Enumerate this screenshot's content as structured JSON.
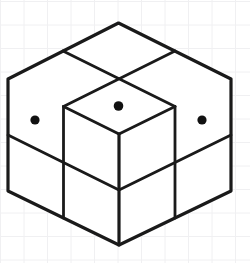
{
  "canvas": {
    "width": 250,
    "height": 263,
    "background_color": "#ffffff",
    "title": "Isometric cube illustration"
  },
  "background_grid": {
    "visible": true,
    "line_color": "#f0f0f2",
    "line_width": 1,
    "spacing": 23.5,
    "offset_x": 0.5,
    "offset_y": 1.5,
    "description": "faint light-gray graph paper grid"
  },
  "figure": {
    "name": "isometric-cube",
    "stroke_color": "#1a1a1a",
    "fill_color": "#ffffff",
    "outline_width": 3.2,
    "divider_width": 2.8
  },
  "geometry": {
    "apex_top": [
      118.5,
      23
    ],
    "vertex_left": [
      8,
      79
    ],
    "vertex_right": [
      231,
      79
    ],
    "vertex_center": [
      119,
      134
    ],
    "bottom_left": [
      8,
      191
    ],
    "bottom_right": [
      231,
      191
    ],
    "bottom_apex": [
      119,
      245
    ],
    "top_edge_mid_left": [
      63,
      51
    ],
    "top_edge_mid_right": [
      175,
      51
    ],
    "top_mid_left": [
      63.5,
      106.5
    ],
    "top_mid_right": [
      175,
      106.5
    ],
    "left_face_mid_v_top": [
      63.5,
      106.5
    ],
    "left_face_mid_v_bottom": [
      63.5,
      218
    ],
    "right_face_mid_v_top": [
      175,
      106.5
    ],
    "right_face_mid_v_bottom": [
      175,
      218
    ],
    "left_face_h_start": [
      8,
      135
    ],
    "left_face_h_end": [
      119,
      190
    ],
    "right_face_h_start": [
      119,
      190
    ],
    "right_face_h_end": [
      231,
      135
    ],
    "outline_path": "M118.5,23 L231,79 L231,191 L119,245 L8,191 L8,79 Z"
  },
  "dots": [
    {
      "name": "dot-left-face",
      "face": "left",
      "cell": "upper-left",
      "cx": 35,
      "cy": 120,
      "r": 4.6,
      "color": "#111111"
    },
    {
      "name": "dot-top-face",
      "face": "top",
      "cell": "front-center",
      "cx": 118.5,
      "cy": 106,
      "r": 4.8,
      "color": "#111111"
    },
    {
      "name": "dot-right-face",
      "face": "right",
      "cell": "upper-right",
      "cx": 202,
      "cy": 120,
      "r": 4.6,
      "color": "#111111"
    }
  ],
  "faces": {
    "top": {
      "label": "top-face",
      "cells": 4,
      "cell_names": [
        "top-back",
        "top-left",
        "top-right",
        "top-front"
      ]
    },
    "left": {
      "label": "left-face",
      "cells": 4,
      "cell_names": [
        "left-upper-left",
        "left-upper-right",
        "left-lower-left",
        "left-lower-right"
      ]
    },
    "right": {
      "label": "right-face",
      "cells": 4,
      "cell_names": [
        "right-upper-left",
        "right-upper-right",
        "right-lower-left",
        "right-lower-right"
      ]
    }
  }
}
